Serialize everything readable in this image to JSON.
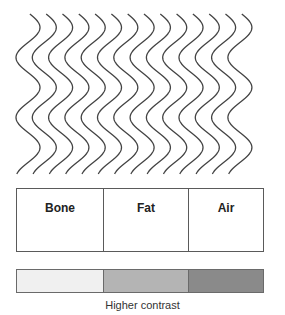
{
  "diagram": {
    "waves": {
      "count": 14,
      "start_x": 28,
      "spacing": 16.3,
      "top_y": 14,
      "bottom_y": 174,
      "amplitude": 12,
      "wavelength": 60,
      "stroke": "#444444"
    },
    "tissues": [
      {
        "label": "Bone",
        "width": 86
      },
      {
        "label": "Fat",
        "width": 85
      },
      {
        "label": "Air",
        "width": 77
      }
    ],
    "contrast_bar": [
      {
        "name": "bone-shade",
        "color": "#f0f0f0",
        "width": 86
      },
      {
        "name": "fat-shade",
        "color": "#b4b4b4",
        "width": 85
      },
      {
        "name": "air-shade",
        "color": "#8a8a8a",
        "width": 77
      }
    ],
    "caption": "Higher contrast"
  }
}
